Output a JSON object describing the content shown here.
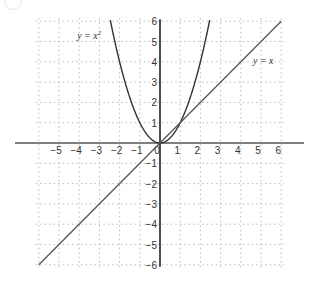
{
  "chart_data": {
    "type": "line",
    "title": "",
    "xlabel": "",
    "ylabel": "",
    "xlim": [
      -6,
      6
    ],
    "ylim": [
      -6,
      6
    ],
    "grid": true,
    "grid_style": "dotted",
    "x_ticks": [
      -5,
      -4,
      -3,
      -2,
      -1,
      0,
      1,
      2,
      3,
      4,
      5,
      6
    ],
    "y_ticks": [
      -6,
      -5,
      -4,
      -3,
      -2,
      -1,
      1,
      2,
      3,
      4,
      5,
      6
    ],
    "series": [
      {
        "name": "y = x^2",
        "label": "y = x",
        "label_sup": "2",
        "function": "x^2",
        "x": [
          -2.45,
          -2,
          -1.5,
          -1,
          -0.5,
          0,
          0.5,
          1,
          1.5,
          2,
          2.45
        ],
        "values": [
          6,
          4,
          2.25,
          1,
          0.25,
          0,
          0.25,
          1,
          2.25,
          4,
          6
        ]
      },
      {
        "name": "y = x",
        "label": "y = x",
        "function": "x",
        "x": [
          -6,
          6
        ],
        "values": [
          -6,
          6
        ]
      }
    ],
    "annotations": [
      {
        "text": "y = x²",
        "x": -4.1,
        "y": 5.1
      },
      {
        "text": "y = x",
        "x": 4.6,
        "y": 3.9
      }
    ],
    "intersections": [
      [
        0,
        0
      ],
      [
        1,
        1
      ]
    ]
  },
  "colors": {
    "axis": "#555555",
    "grid": "#bbbbbb",
    "curve": "#333333",
    "line": "#555555",
    "text": "#333333"
  }
}
